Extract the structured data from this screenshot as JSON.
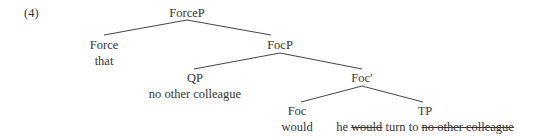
{
  "example_number": "(4)",
  "tree": {
    "root": {
      "label": "ForceP"
    },
    "force": {
      "label": "Force",
      "word": "that"
    },
    "focp": {
      "label": "FocP"
    },
    "qp": {
      "label": "QP",
      "word": "no other colleague"
    },
    "focbar": {
      "label": "Foc′"
    },
    "foc": {
      "label": "Foc",
      "word": "would"
    },
    "tp": {
      "label": "TP",
      "words": [
        {
          "text": "he",
          "struck": false
        },
        {
          "text": "would",
          "struck": true
        },
        {
          "text": "turn to",
          "struck": false
        },
        {
          "text": "no other colleague",
          "struck": true
        }
      ]
    }
  }
}
